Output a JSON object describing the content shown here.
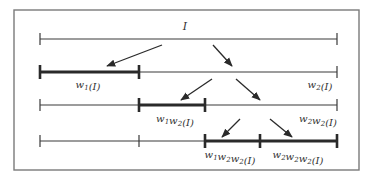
{
  "diagram": {
    "frame": {
      "x": 14,
      "y": 10,
      "width": 345,
      "height": 160,
      "stroke": "#7a7a7a"
    },
    "colors": {
      "line": "#3a3a3a",
      "bold_line": "#2a2a2a",
      "text": "#333333"
    },
    "top_label": {
      "text": "I",
      "x": 185,
      "y": 30
    },
    "rows": [
      {
        "id": "row-0",
        "y": 39,
        "segments": [
          {
            "from": 40,
            "to": 337,
            "bold": false
          }
        ],
        "ticks": [
          {
            "x": 40,
            "bold": false
          },
          {
            "x": 337,
            "bold": false
          }
        ],
        "labels": []
      },
      {
        "id": "row-1",
        "y": 72,
        "segments": [
          {
            "from": 40,
            "to": 139,
            "bold": true
          },
          {
            "from": 139,
            "to": 337,
            "bold": false
          }
        ],
        "ticks": [
          {
            "x": 40,
            "bold": true
          },
          {
            "x": 139,
            "bold": true
          },
          {
            "x": 337,
            "bold": false
          }
        ],
        "labels": [
          {
            "name": "w1-label",
            "base": "w",
            "parts": [
              [
                "w",
                "1"
              ]
            ],
            "text": "w1(I)",
            "x": 88,
            "y": 88
          },
          {
            "name": "w2-label",
            "parts": [
              [
                "w",
                "2"
              ]
            ],
            "text": "w2(I)",
            "x": 320,
            "y": 88
          }
        ]
      },
      {
        "id": "row-2",
        "y": 105,
        "segments": [
          {
            "from": 40,
            "to": 139,
            "bold": false
          },
          {
            "from": 139,
            "to": 205,
            "bold": true
          },
          {
            "from": 205,
            "to": 337,
            "bold": false
          }
        ],
        "ticks": [
          {
            "x": 40,
            "bold": false
          },
          {
            "x": 139,
            "bold": true
          },
          {
            "x": 205,
            "bold": true
          },
          {
            "x": 337,
            "bold": false
          }
        ],
        "labels": [
          {
            "name": "w1w2-label",
            "parts": [
              [
                "w",
                "1"
              ],
              [
                "w",
                "2"
              ]
            ],
            "text": "w1w2(I)",
            "x": 175,
            "y": 122
          },
          {
            "name": "w2w2-label",
            "parts": [
              [
                "w",
                "2"
              ],
              [
                "w",
                "2"
              ]
            ],
            "text": "w2w2(I)",
            "x": 318,
            "y": 122
          }
        ]
      },
      {
        "id": "row-3",
        "y": 141,
        "segments": [
          {
            "from": 40,
            "to": 205,
            "bold": false
          },
          {
            "from": 205,
            "to": 260,
            "bold": true
          },
          {
            "from": 260,
            "to": 337,
            "bold": true
          }
        ],
        "ticks": [
          {
            "x": 40,
            "bold": false
          },
          {
            "x": 139,
            "bold": false
          },
          {
            "x": 205,
            "bold": true
          },
          {
            "x": 260,
            "bold": true
          },
          {
            "x": 337,
            "bold": true
          }
        ],
        "labels": [
          {
            "name": "w1w2w2-label",
            "parts": [
              [
                "w",
                "1"
              ],
              [
                "w",
                "2"
              ],
              [
                "w",
                "2"
              ]
            ],
            "text": "w1w2w2(I)",
            "x": 230,
            "y": 158
          },
          {
            "name": "w2w2w2-label",
            "parts": [
              [
                "w",
                "2"
              ],
              [
                "w",
                "2"
              ],
              [
                "w",
                "2"
              ]
            ],
            "text": "w2w2w2(I)",
            "x": 298,
            "y": 158
          }
        ]
      }
    ],
    "arrows": [
      {
        "name": "arrow-to-w1",
        "x1": 162,
        "y1": 45,
        "x2": 107,
        "y2": 66
      },
      {
        "name": "arrow-to-w2",
        "x1": 213,
        "y1": 45,
        "x2": 232,
        "y2": 66
      },
      {
        "name": "arrow-to-w1w2",
        "x1": 212,
        "y1": 79,
        "x2": 181,
        "y2": 100
      },
      {
        "name": "arrow-to-w2w2",
        "x1": 236,
        "y1": 79,
        "x2": 260,
        "y2": 100
      },
      {
        "name": "arrow-to-w1w2w2",
        "x1": 240,
        "y1": 119,
        "x2": 222,
        "y2": 137
      },
      {
        "name": "arrow-to-w2w2w2",
        "x1": 270,
        "y1": 119,
        "x2": 292,
        "y2": 137
      }
    ]
  }
}
